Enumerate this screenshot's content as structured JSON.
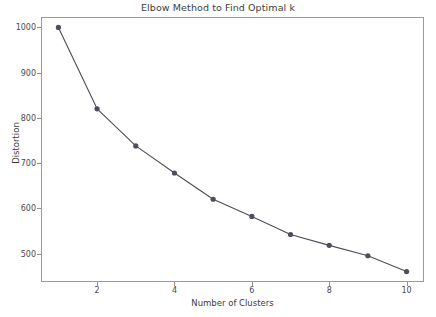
{
  "chart_data": {
    "type": "line",
    "title": "Elbow Method to Find Optimal k",
    "xlabel": "Number of Clusters",
    "ylabel": "Distortion",
    "x": [
      1,
      2,
      3,
      4,
      5,
      6,
      7,
      8,
      9,
      10
    ],
    "values": [
      1000,
      820,
      738,
      678,
      620,
      582,
      542,
      518,
      495,
      460
    ],
    "series": [
      {
        "name": "Distortion",
        "values": [
          1000,
          820,
          738,
          678,
          620,
          582,
          542,
          518,
          495,
          460
        ]
      }
    ],
    "xlim": [
      0.55,
      10.45
    ],
    "ylim": [
      437,
      1023
    ],
    "xticks": [
      2,
      4,
      6,
      8,
      10
    ],
    "xtick_labels": [
      "2",
      "4",
      "6",
      "8",
      "10"
    ],
    "yticks": [
      500,
      600,
      700,
      800,
      900,
      1000
    ],
    "ytick_labels": [
      "500",
      "600",
      "700",
      "800",
      "900",
      "1000"
    ],
    "grid": false,
    "legend": null,
    "marker": "circle",
    "line_color": "#4d4d5c",
    "marker_color": "#4d4d5c",
    "frame_color": "#9a9aa2",
    "background_color": "#ffffff"
  }
}
